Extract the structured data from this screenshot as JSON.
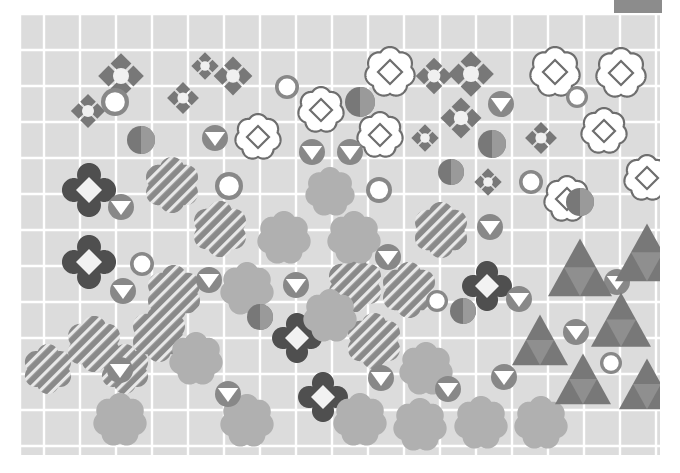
{
  "figure": {
    "title": "",
    "background_color": "#ffffff",
    "plot_background_color": "#dcdcdc",
    "grid_color": "#ffffff",
    "plot_rect": {
      "x": 20,
      "y": 14,
      "width": 640,
      "height": 441
    },
    "grid": {
      "x_lines": [
        20,
        44,
        80,
        116,
        152,
        188,
        224,
        260,
        296,
        332,
        368,
        404,
        440,
        476,
        512,
        548,
        584,
        620,
        656
      ],
      "y_lines": [
        14,
        50,
        86,
        122,
        158,
        194,
        230,
        266,
        302,
        338,
        374,
        410,
        446
      ]
    }
  },
  "legend_swatch": {
    "label": "legend-color-swatch",
    "color": "#8c8c8c",
    "rect": {
      "x": 614,
      "y": 0,
      "width": 48,
      "height": 13
    }
  },
  "palette": {
    "dark_gray": "#4f4f4f",
    "mid_gray": "#787878",
    "mid_gray_alt": "#888888",
    "light_gray": "#b0b0b0",
    "hatch_gray": "#8a8a8a",
    "white": "#ffffff",
    "outline_gray": "#6e6e6e",
    "grid_white": "#ffffff",
    "panel_gray": "#dcdcdc"
  },
  "chart_data": {
    "type": "scatter",
    "title": "",
    "xlabel": "",
    "ylabel": "",
    "xlim": [
      0,
      640
    ],
    "ylim": [
      0,
      441
    ],
    "grid": true,
    "legend_position": "top-right",
    "marker_classes": [
      {
        "name": "flower-dark-diamond",
        "description": "dark gray 4-lobe clover with white diamond center",
        "count": 5
      },
      {
        "name": "flower-white-diamond",
        "description": "white 6-lobe flower outlined gray with inner diamond outline",
        "count": 9
      },
      {
        "name": "flower-hatched",
        "description": "mid gray 6-lobe flower with diagonal white hatching",
        "count": 11
      },
      {
        "name": "flower-light-solid",
        "description": "light gray 6-lobe solid flower",
        "count": 13
      },
      {
        "name": "diamond-cluster",
        "description": "four mid gray diamonds around a white circular center",
        "count": 11
      },
      {
        "name": "circle-white-center",
        "description": "gray ring circle with large white center",
        "count": 9
      },
      {
        "name": "circle-triangle",
        "description": "gray circle with white downward triangle",
        "count": 14
      },
      {
        "name": "circle-half",
        "description": "circle split into two gray tones",
        "count": 7
      },
      {
        "name": "triangle-nested",
        "description": "gray triangle with nested lighter inner triangle",
        "count": 9
      }
    ],
    "points": [
      {
        "cls": "diamond-cluster",
        "x": 101,
        "y": 62,
        "r": 20
      },
      {
        "cls": "diamond-cluster",
        "x": 213,
        "y": 62,
        "r": 17
      },
      {
        "cls": "diamond-cluster",
        "x": 451,
        "y": 60,
        "r": 20
      },
      {
        "cls": "diamond-cluster",
        "x": 163,
        "y": 84,
        "r": 14
      },
      {
        "cls": "diamond-cluster",
        "x": 68,
        "y": 97,
        "r": 15
      },
      {
        "cls": "diamond-cluster",
        "x": 441,
        "y": 104,
        "r": 18
      },
      {
        "cls": "diamond-cluster",
        "x": 521,
        "y": 124,
        "r": 14
      },
      {
        "cls": "diamond-cluster",
        "x": 468,
        "y": 168,
        "r": 12
      },
      {
        "cls": "diamond-cluster",
        "x": 185,
        "y": 52,
        "r": 12
      },
      {
        "cls": "diamond-cluster",
        "x": 414,
        "y": 62,
        "r": 16
      },
      {
        "cls": "diamond-cluster",
        "x": 405,
        "y": 124,
        "r": 12
      },
      {
        "cls": "flower-white-diamond",
        "x": 370,
        "y": 58,
        "r": 24
      },
      {
        "cls": "flower-white-diamond",
        "x": 535,
        "y": 58,
        "r": 24
      },
      {
        "cls": "flower-white-diamond",
        "x": 601,
        "y": 59,
        "r": 24
      },
      {
        "cls": "flower-white-diamond",
        "x": 301,
        "y": 96,
        "r": 22
      },
      {
        "cls": "flower-white-diamond",
        "x": 360,
        "y": 121,
        "r": 22
      },
      {
        "cls": "flower-white-diamond",
        "x": 238,
        "y": 123,
        "r": 22
      },
      {
        "cls": "flower-white-diamond",
        "x": 584,
        "y": 117,
        "r": 22
      },
      {
        "cls": "flower-white-diamond",
        "x": 627,
        "y": 164,
        "r": 22
      },
      {
        "cls": "flower-white-diamond",
        "x": 547,
        "y": 185,
        "r": 22
      },
      {
        "cls": "flower-dark-diamond",
        "x": 69,
        "y": 176,
        "r": 26
      },
      {
        "cls": "flower-dark-diamond",
        "x": 69,
        "y": 248,
        "r": 26
      },
      {
        "cls": "flower-dark-diamond",
        "x": 277,
        "y": 324,
        "r": 24
      },
      {
        "cls": "flower-dark-diamond",
        "x": 303,
        "y": 383,
        "r": 24
      },
      {
        "cls": "flower-dark-diamond",
        "x": 467,
        "y": 272,
        "r": 24
      },
      {
        "cls": "flower-hatched",
        "x": 152,
        "y": 171,
        "r": 27
      },
      {
        "cls": "flower-hatched",
        "x": 200,
        "y": 215,
        "r": 27
      },
      {
        "cls": "flower-hatched",
        "x": 421,
        "y": 216,
        "r": 27
      },
      {
        "cls": "flower-hatched",
        "x": 154,
        "y": 279,
        "r": 27
      },
      {
        "cls": "flower-hatched",
        "x": 335,
        "y": 270,
        "r": 27
      },
      {
        "cls": "flower-hatched",
        "x": 389,
        "y": 276,
        "r": 27
      },
      {
        "cls": "flower-hatched",
        "x": 74,
        "y": 330,
        "r": 27
      },
      {
        "cls": "flower-hatched",
        "x": 139,
        "y": 320,
        "r": 27
      },
      {
        "cls": "flower-hatched",
        "x": 354,
        "y": 327,
        "r": 27
      },
      {
        "cls": "flower-hatched",
        "x": 28,
        "y": 355,
        "r": 24
      },
      {
        "cls": "flower-hatched",
        "x": 105,
        "y": 355,
        "r": 24
      },
      {
        "cls": "flower-light-solid",
        "x": 310,
        "y": 178,
        "r": 24
      },
      {
        "cls": "flower-light-solid",
        "x": 264,
        "y": 224,
        "r": 26
      },
      {
        "cls": "flower-light-solid",
        "x": 334,
        "y": 224,
        "r": 26
      },
      {
        "cls": "flower-light-solid",
        "x": 227,
        "y": 275,
        "r": 26
      },
      {
        "cls": "flower-light-solid",
        "x": 310,
        "y": 302,
        "r": 26
      },
      {
        "cls": "flower-light-solid",
        "x": 176,
        "y": 345,
        "r": 26
      },
      {
        "cls": "flower-light-solid",
        "x": 406,
        "y": 355,
        "r": 26
      },
      {
        "cls": "flower-light-solid",
        "x": 100,
        "y": 406,
        "r": 26
      },
      {
        "cls": "flower-light-solid",
        "x": 227,
        "y": 407,
        "r": 26
      },
      {
        "cls": "flower-light-solid",
        "x": 340,
        "y": 406,
        "r": 26
      },
      {
        "cls": "flower-light-solid",
        "x": 400,
        "y": 411,
        "r": 26
      },
      {
        "cls": "flower-light-solid",
        "x": 461,
        "y": 409,
        "r": 26
      },
      {
        "cls": "flower-light-solid",
        "x": 521,
        "y": 409,
        "r": 26
      },
      {
        "cls": "circle-white-center",
        "x": 95,
        "y": 88,
        "r": 14
      },
      {
        "cls": "circle-white-center",
        "x": 267,
        "y": 73,
        "r": 12
      },
      {
        "cls": "circle-white-center",
        "x": 557,
        "y": 83,
        "r": 11
      },
      {
        "cls": "circle-white-center",
        "x": 209,
        "y": 172,
        "r": 14
      },
      {
        "cls": "circle-white-center",
        "x": 511,
        "y": 168,
        "r": 12
      },
      {
        "cls": "circle-white-center",
        "x": 122,
        "y": 250,
        "r": 12
      },
      {
        "cls": "circle-white-center",
        "x": 417,
        "y": 287,
        "r": 11
      },
      {
        "cls": "circle-white-center",
        "x": 591,
        "y": 349,
        "r": 11
      },
      {
        "cls": "circle-white-center",
        "x": 359,
        "y": 176,
        "r": 13
      },
      {
        "cls": "circle-triangle",
        "x": 481,
        "y": 90,
        "r": 13
      },
      {
        "cls": "circle-triangle",
        "x": 195,
        "y": 124,
        "r": 13
      },
      {
        "cls": "circle-triangle",
        "x": 292,
        "y": 138,
        "r": 13
      },
      {
        "cls": "circle-triangle",
        "x": 330,
        "y": 138,
        "r": 13
      },
      {
        "cls": "circle-triangle",
        "x": 101,
        "y": 193,
        "r": 13
      },
      {
        "cls": "circle-triangle",
        "x": 470,
        "y": 213,
        "r": 13
      },
      {
        "cls": "circle-triangle",
        "x": 368,
        "y": 243,
        "r": 13
      },
      {
        "cls": "circle-triangle",
        "x": 103,
        "y": 277,
        "r": 13
      },
      {
        "cls": "circle-triangle",
        "x": 189,
        "y": 266,
        "r": 13
      },
      {
        "cls": "circle-triangle",
        "x": 276,
        "y": 271,
        "r": 13
      },
      {
        "cls": "circle-triangle",
        "x": 499,
        "y": 285,
        "r": 13
      },
      {
        "cls": "circle-triangle",
        "x": 556,
        "y": 318,
        "r": 13
      },
      {
        "cls": "circle-triangle",
        "x": 100,
        "y": 356,
        "r": 13
      },
      {
        "cls": "circle-triangle",
        "x": 208,
        "y": 380,
        "r": 13
      },
      {
        "cls": "circle-triangle",
        "x": 361,
        "y": 364,
        "r": 13
      },
      {
        "cls": "circle-triangle",
        "x": 428,
        "y": 375,
        "r": 13
      },
      {
        "cls": "circle-triangle",
        "x": 484,
        "y": 363,
        "r": 13
      },
      {
        "cls": "circle-triangle",
        "x": 597,
        "y": 268,
        "r": 13
      },
      {
        "cls": "circle-half",
        "x": 340,
        "y": 88,
        "r": 15
      },
      {
        "cls": "circle-half",
        "x": 121,
        "y": 126,
        "r": 14
      },
      {
        "cls": "circle-half",
        "x": 472,
        "y": 130,
        "r": 14
      },
      {
        "cls": "circle-half",
        "x": 560,
        "y": 188,
        "r": 14
      },
      {
        "cls": "circle-half",
        "x": 240,
        "y": 303,
        "r": 13
      },
      {
        "cls": "circle-half",
        "x": 443,
        "y": 297,
        "r": 13
      },
      {
        "cls": "circle-half",
        "x": 431,
        "y": 158,
        "r": 13
      },
      {
        "cls": "triangle-nested",
        "x": 560,
        "y": 258,
        "r": 32
      },
      {
        "cls": "triangle-nested",
        "x": 627,
        "y": 243,
        "r": 32
      },
      {
        "cls": "triangle-nested",
        "x": 601,
        "y": 310,
        "r": 30
      },
      {
        "cls": "triangle-nested",
        "x": 520,
        "y": 330,
        "r": 28
      },
      {
        "cls": "triangle-nested",
        "x": 563,
        "y": 369,
        "r": 28
      },
      {
        "cls": "triangle-nested",
        "x": 627,
        "y": 374,
        "r": 28
      }
    ]
  }
}
